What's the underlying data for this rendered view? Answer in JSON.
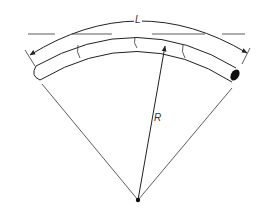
{
  "diagram": {
    "type": "bent tube with arc length and radius annotation",
    "labels": {
      "arc_length": "L",
      "radius": "R"
    },
    "elements": [
      {
        "name": "curved-tube",
        "description": "Curved tube segment bent along an arc, with three section marks"
      },
      {
        "name": "arc-length-dimension",
        "description": "Curved dimension line above the tube with arrowheads at both ends labeled L"
      },
      {
        "name": "reference-line",
        "description": "Horizontal dashed tangent line at the top of the arc"
      },
      {
        "name": "radial-lines",
        "description": "Two lines from the center point to the tube ends"
      },
      {
        "name": "radius-arrow",
        "description": "Arrow from the center point to the tube labeled R"
      },
      {
        "name": "center-point",
        "description": "Filled dot at the center of curvature"
      }
    ],
    "colors": {
      "line": "#222222",
      "background": "#ffffff"
    }
  }
}
